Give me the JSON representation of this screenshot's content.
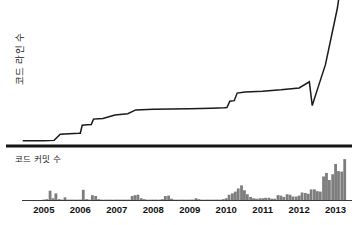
{
  "chart_data": {
    "type": "line",
    "title": "",
    "subtitle": "",
    "ylabel": "코드 라인 수",
    "xlabel": "",
    "grid": false,
    "legend_position": "none",
    "xlim": [
      2004.4,
      2013.45
    ],
    "xticks": [
      2005,
      2006,
      2007,
      2008,
      2009,
      2010,
      2011,
      2012,
      2013
    ],
    "xtick_labels": [
      "2005",
      "2006",
      "2007",
      "2008",
      "2009",
      "2010",
      "2011",
      "2012",
      "2013"
    ],
    "panels": [
      {
        "name": "lines-of-code",
        "type": "line",
        "ylabel": "코드 라인 수",
        "ylim": [
          0,
          100
        ],
        "note": "cumulative lines of code; rises in steps, dips slightly in mid-2012, then spikes vertically past the top of the plot in late 2012 / 2013",
        "series": [
          {
            "name": "코드 라인 수",
            "color": "#1a1a1a",
            "points": [
              [
                2004.42,
                2.0
              ],
              [
                2005.0,
                2.0
              ],
              [
                2005.28,
                2.3
              ],
              [
                2005.45,
                6.8
              ],
              [
                2005.95,
                7.5
              ],
              [
                2006.0,
                7.6
              ],
              [
                2006.05,
                13.5
              ],
              [
                2006.2,
                13.9
              ],
              [
                2006.3,
                14.0
              ],
              [
                2006.36,
                18.0
              ],
              [
                2006.5,
                18.2
              ],
              [
                2006.62,
                18.4
              ],
              [
                2006.95,
                21.0
              ],
              [
                2007.3,
                22.0
              ],
              [
                2007.52,
                24.8
              ],
              [
                2008.0,
                25.2
              ],
              [
                2009.0,
                25.6
              ],
              [
                2009.6,
                26.0
              ],
              [
                2009.95,
                26.3
              ],
              [
                2010.02,
                26.5
              ],
              [
                2010.1,
                31.2
              ],
              [
                2010.22,
                31.6
              ],
              [
                2010.3,
                37.2
              ],
              [
                2010.52,
                38.0
              ],
              [
                2011.0,
                38.6
              ],
              [
                2011.5,
                39.6
              ],
              [
                2012.0,
                41.0
              ],
              [
                2012.28,
                45.5
              ],
              [
                2012.36,
                28.0
              ],
              [
                2012.55,
                44.0
              ],
              [
                2012.72,
                58.0
              ],
              [
                2013.05,
                100.0
              ],
              [
                2013.22,
                132.0
              ]
            ]
          }
        ]
      },
      {
        "name": "code-commits",
        "type": "bar",
        "ylabel": "코드 커밋 수",
        "ylim": [
          0,
          100
        ],
        "bar_color": "#7d7d7d",
        "x": [
          2004.5,
          2004.58,
          2004.67,
          2004.75,
          2004.83,
          2004.92,
          2005.0,
          2005.08,
          2005.17,
          2005.25,
          2005.33,
          2005.42,
          2005.5,
          2005.58,
          2005.67,
          2005.75,
          2005.83,
          2005.92,
          2006.0,
          2006.08,
          2006.17,
          2006.25,
          2006.33,
          2006.42,
          2006.5,
          2006.58,
          2006.67,
          2006.75,
          2006.83,
          2006.92,
          2007.0,
          2007.08,
          2007.17,
          2007.25,
          2007.33,
          2007.42,
          2007.5,
          2007.58,
          2007.67,
          2007.75,
          2007.83,
          2007.92,
          2008.0,
          2008.08,
          2008.17,
          2008.25,
          2008.33,
          2008.42,
          2008.5,
          2008.58,
          2008.67,
          2008.75,
          2008.83,
          2008.92,
          2009.0,
          2009.08,
          2009.17,
          2009.25,
          2009.33,
          2009.42,
          2009.5,
          2009.58,
          2009.67,
          2009.75,
          2009.83,
          2009.92,
          2010.0,
          2010.08,
          2010.17,
          2010.25,
          2010.33,
          2010.42,
          2010.5,
          2010.58,
          2010.67,
          2010.75,
          2010.83,
          2010.92,
          2011.0,
          2011.08,
          2011.17,
          2011.25,
          2011.33,
          2011.42,
          2011.5,
          2011.58,
          2011.67,
          2011.75,
          2011.83,
          2011.92,
          2012.0,
          2012.08,
          2012.17,
          2012.25,
          2012.33,
          2012.42,
          2012.5,
          2012.58,
          2012.67,
          2012.75,
          2012.83,
          2012.92,
          2013.0,
          2013.08,
          2013.17,
          2013.25,
          2013.33
        ],
        "values": [
          0,
          0,
          0,
          0,
          0,
          0,
          2,
          3,
          22,
          5,
          16,
          3,
          2,
          7,
          2,
          2,
          2,
          2,
          2,
          24,
          3,
          2,
          12,
          10,
          3,
          2,
          2,
          2,
          2,
          2,
          2,
          2,
          2,
          2,
          2,
          10,
          12,
          13,
          5,
          3,
          2,
          2,
          2,
          2,
          2,
          3,
          10,
          11,
          4,
          2,
          2,
          2,
          2,
          2,
          2,
          2,
          5,
          3,
          2,
          2,
          2,
          2,
          2,
          2,
          2,
          3,
          5,
          13,
          16,
          20,
          27,
          34,
          23,
          14,
          8,
          5,
          4,
          5,
          5,
          6,
          6,
          4,
          4,
          12,
          11,
          8,
          14,
          13,
          9,
          9,
          11,
          18,
          17,
          15,
          25,
          25,
          21,
          20,
          54,
          62,
          46,
          59,
          82,
          66,
          65,
          93,
          0
        ]
      }
    ]
  },
  "axis": {
    "baseline_color": "#3a3a3a",
    "divider_color": "#141414"
  }
}
